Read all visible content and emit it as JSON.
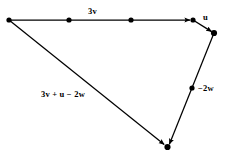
{
  "figure": {
    "type": "vector-addition-diagram",
    "background_color": "#ffffff",
    "stroke_color": "#000000",
    "labels": {
      "three_v": "3v",
      "u": "u",
      "negative_two_w": "−2w",
      "resultant": "3v + u − 2w"
    },
    "vertices": {
      "origin": {
        "x": 9,
        "y": 20
      },
      "v_mid_1": {
        "x": 69,
        "y": 20
      },
      "v_mid_2": {
        "x": 131,
        "y": 20
      },
      "v_end": {
        "x": 193,
        "y": 20
      },
      "u_end": {
        "x": 214,
        "y": 33
      },
      "w_mid": {
        "x": 192,
        "y": 88
      },
      "terminus": {
        "x": 167,
        "y": 147
      }
    },
    "edges": [
      {
        "name": "three-v-vector",
        "label": "3v",
        "from": "origin",
        "to": "v_end",
        "arrow": true
      },
      {
        "name": "u-vector",
        "label": "u",
        "from": "v_end",
        "to": "u_end",
        "arrow": true
      },
      {
        "name": "negative-two-w-vector",
        "label": "−2w",
        "from": "u_end",
        "to": "terminus",
        "arrow": true
      },
      {
        "name": "resultant-vector",
        "label": "3v + u − 2w",
        "from": "origin",
        "to": "terminus",
        "arrow": true
      }
    ]
  }
}
